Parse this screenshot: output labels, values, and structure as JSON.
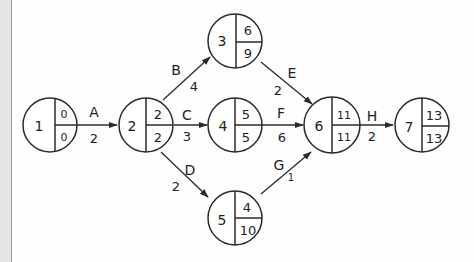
{
  "colors": {
    "stroke": "#2b2b2b",
    "text": "#222222",
    "background": "#fefefe",
    "sidebar": "#e6e6e6"
  },
  "nodes": [
    {
      "id": "1",
      "earliest": "0",
      "latest": "0"
    },
    {
      "id": "2",
      "earliest": "2",
      "latest": "2"
    },
    {
      "id": "3",
      "earliest": "6",
      "latest": "9"
    },
    {
      "id": "4",
      "earliest": "5",
      "latest": "5"
    },
    {
      "id": "5",
      "earliest": "4",
      "latest": "10"
    },
    {
      "id": "6",
      "earliest": "11",
      "latest": "11"
    },
    {
      "id": "7",
      "earliest": "13",
      "latest": "13"
    }
  ],
  "edges": [
    {
      "activity": "A",
      "duration": "2",
      "from": "1",
      "to": "2"
    },
    {
      "activity": "B",
      "duration": "4",
      "from": "2",
      "to": "3"
    },
    {
      "activity": "C",
      "duration": "3",
      "from": "2",
      "to": "4"
    },
    {
      "activity": "D",
      "duration": "2",
      "from": "2",
      "to": "5"
    },
    {
      "activity": "E",
      "duration": "2",
      "from": "3",
      "to": "6"
    },
    {
      "activity": "F",
      "duration": "6",
      "from": "4",
      "to": "6"
    },
    {
      "activity": "G",
      "duration": "1",
      "from": "5",
      "to": "6"
    },
    {
      "activity": "H",
      "duration": "2",
      "from": "6",
      "to": "7"
    }
  ]
}
